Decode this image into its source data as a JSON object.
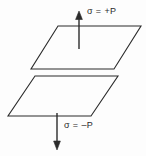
{
  "figure": {
    "type": "physics-diagram",
    "background_color": "#fdfdfd",
    "stroke_color": "#2b2b2b",
    "labels": {
      "top": "σ = +P",
      "bottom": "σ = –P"
    },
    "annotations": {
      "top_symbol": "σ",
      "top_relation": "=",
      "top_value": "+P",
      "bottom_symbol": "σ",
      "bottom_relation": "=",
      "bottom_value": "–P"
    },
    "shapes": [
      {
        "name": "top-plane",
        "kind": "parallelogram",
        "points": "58,26 141,26 114,69 31,69"
      },
      {
        "name": "bottom-plane",
        "kind": "parallelogram",
        "points": "35,76 118,76 91,116 8,116"
      }
    ],
    "arrows": [
      {
        "name": "up-arrow",
        "direction": "up",
        "x": 79,
        "tip_y": 12,
        "tail_y": 49,
        "label": "σ = +P"
      },
      {
        "name": "down-arrow",
        "direction": "down",
        "x": 57,
        "tip_y": 149,
        "tail_y": 113,
        "label": "σ = –P"
      }
    ]
  }
}
